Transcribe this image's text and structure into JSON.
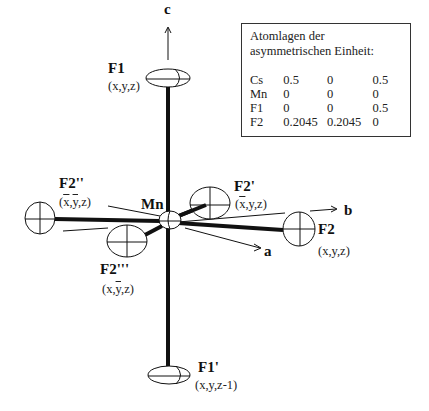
{
  "axes": {
    "a": "a",
    "b": "b",
    "c": "c"
  },
  "atoms": {
    "mn": {
      "label": "Mn"
    },
    "f1": {
      "label": "F1",
      "coord": "(x,y,z)"
    },
    "f1p": {
      "label": "F1'",
      "coord": "(x,y,z-1)"
    },
    "f2": {
      "label": "F2",
      "coord": "(x,y,z)"
    },
    "f2p": {
      "label": "F2'",
      "coord_pre": "(",
      "coord_bar": "x",
      "coord_post": ",y,z)"
    },
    "f2pp": {
      "label": "F2''",
      "coord_pre": "(",
      "coord_bar1": "x",
      "coord_mid": ",",
      "coord_bar2": "y",
      "coord_post": ",z)"
    },
    "f2ppp": {
      "label": "F2'''",
      "coord_pre": "(x,",
      "coord_bar": "y",
      "coord_post": ",z)"
    }
  },
  "table": {
    "title_line1": "Atomlagen der",
    "title_line2": "asymmetrischen Einheit:",
    "rows": [
      {
        "atom": "Cs",
        "x": "0.5",
        "y": "0",
        "z": "0.5"
      },
      {
        "atom": "Mn",
        "x": "0",
        "y": "0",
        "z": "0"
      },
      {
        "atom": "F1",
        "x": "0",
        "y": "0",
        "z": "0.5"
      },
      {
        "atom": "F2",
        "x": "0.2045",
        "y": "0.2045",
        "z": "0"
      }
    ]
  }
}
